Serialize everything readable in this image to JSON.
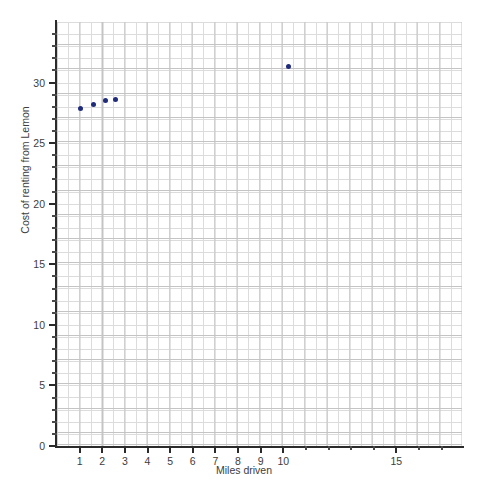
{
  "chart_data": {
    "type": "scatter",
    "title": "",
    "xlabel": "Miles driven",
    "ylabel": "Cost of renting from Lemon",
    "xlim": [
      0,
      17.9
    ],
    "ylim": [
      0,
      35
    ],
    "grid": true,
    "legend": "none",
    "marker_color": "#1f2b7b",
    "x": [
      1.05,
      1.6,
      2.15,
      2.6,
      10.25
    ],
    "y": [
      27.9,
      28.2,
      28.5,
      28.6,
      31.3
    ],
    "points": [
      {
        "x": 1.05,
        "y": 27.9
      },
      {
        "x": 1.6,
        "y": 28.2
      },
      {
        "x": 2.15,
        "y": 28.5
      },
      {
        "x": 2.6,
        "y": 28.6
      },
      {
        "x": 10.25,
        "y": 31.3
      }
    ],
    "x_ticks": [
      {
        "value": 1,
        "label": "1"
      },
      {
        "value": 2,
        "label": "2"
      },
      {
        "value": 3,
        "label": "3"
      },
      {
        "value": 4,
        "label": "4"
      },
      {
        "value": 5,
        "label": "5"
      },
      {
        "value": 6,
        "label": "6"
      },
      {
        "value": 7,
        "label": "7"
      },
      {
        "value": 8,
        "label": "8"
      },
      {
        "value": 9,
        "label": "9"
      },
      {
        "value": 10,
        "label": "10"
      },
      {
        "value": 11,
        "label": ""
      },
      {
        "value": 12,
        "label": ""
      },
      {
        "value": 13,
        "label": ""
      },
      {
        "value": 14,
        "label": ""
      },
      {
        "value": 15,
        "label": "15"
      },
      {
        "value": 16,
        "label": ""
      },
      {
        "value": 17,
        "label": ""
      }
    ],
    "y_ticks": [
      {
        "value": 0,
        "label": "0"
      },
      {
        "value": 1,
        "label": ""
      },
      {
        "value": 2,
        "label": ""
      },
      {
        "value": 3,
        "label": ""
      },
      {
        "value": 4,
        "label": ""
      },
      {
        "value": 5,
        "label": "5"
      },
      {
        "value": 6,
        "label": ""
      },
      {
        "value": 7,
        "label": ""
      },
      {
        "value": 8,
        "label": ""
      },
      {
        "value": 9,
        "label": ""
      },
      {
        "value": 10,
        "label": "10"
      },
      {
        "value": 11,
        "label": ""
      },
      {
        "value": 12,
        "label": ""
      },
      {
        "value": 13,
        "label": ""
      },
      {
        "value": 14,
        "label": ""
      },
      {
        "value": 15,
        "label": "15"
      },
      {
        "value": 16,
        "label": ""
      },
      {
        "value": 17,
        "label": ""
      },
      {
        "value": 18,
        "label": ""
      },
      {
        "value": 19,
        "label": ""
      },
      {
        "value": 20,
        "label": "20"
      },
      {
        "value": 21,
        "label": ""
      },
      {
        "value": 22,
        "label": ""
      },
      {
        "value": 23,
        "label": ""
      },
      {
        "value": 24,
        "label": ""
      },
      {
        "value": 25,
        "label": "25"
      },
      {
        "value": 26,
        "label": ""
      },
      {
        "value": 27,
        "label": ""
      },
      {
        "value": 28,
        "label": ""
      },
      {
        "value": 29,
        "label": ""
      },
      {
        "value": 30,
        "label": "30"
      },
      {
        "value": 31,
        "label": ""
      },
      {
        "value": 32,
        "label": ""
      },
      {
        "value": 33,
        "label": ""
      },
      {
        "value": 34,
        "label": ""
      }
    ]
  }
}
